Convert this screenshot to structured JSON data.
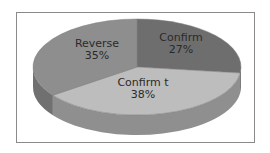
{
  "chart_data": {
    "type": "pie",
    "title": "",
    "style": "3d",
    "categories": [
      "Confirm",
      "Confirm t",
      "Reverse"
    ],
    "values": [
      27,
      38,
      35
    ],
    "labels": [
      {
        "name": "Confirm",
        "percent": "27%"
      },
      {
        "name": "Confirm t",
        "percent": "38%"
      },
      {
        "name": "Reverse",
        "percent": "35%"
      }
    ],
    "colors": [
      "#6e6e6e",
      "#bdbdbd",
      "#8e8e8e"
    ],
    "legend": "none",
    "start_angle": "12 o'clock, clockwise"
  }
}
